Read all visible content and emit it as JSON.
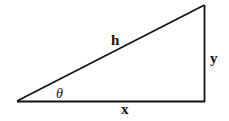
{
  "diagram": {
    "type": "right-triangle",
    "vertices": {
      "angle_vertex": [
        17,
        101
      ],
      "right_angle_vertex": [
        204,
        101
      ],
      "top_vertex": [
        204,
        5
      ]
    },
    "labels": {
      "hypotenuse": "h",
      "opposite": "y",
      "adjacent": "x",
      "angle": "θ"
    },
    "stroke_color": "#111111",
    "background": "#ffffff"
  }
}
